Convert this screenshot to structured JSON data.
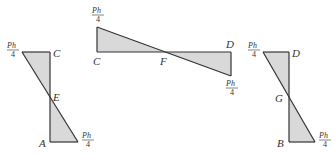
{
  "diagram": {
    "fill_color": "#d9d9d9",
    "stroke_color": "#333333",
    "figures": [
      {
        "id": "left",
        "point_labels": {
          "top": "C",
          "middle": "E",
          "bottom": "A"
        },
        "load_labels": [
          {
            "num": "Ph",
            "den": "4",
            "position": "top-left"
          },
          {
            "num": "Ph",
            "den": "4",
            "position": "bottom-right"
          }
        ]
      },
      {
        "id": "middle",
        "point_labels": {
          "left": "C",
          "middle": "F",
          "right": "D"
        },
        "load_labels": [
          {
            "num": "Ph",
            "den": "4",
            "position": "top-left"
          },
          {
            "num": "Ph",
            "den": "4",
            "position": "bottom-right"
          }
        ]
      },
      {
        "id": "right",
        "point_labels": {
          "top": "D",
          "middle": "G",
          "bottom": "B"
        },
        "load_labels": [
          {
            "num": "Ph",
            "den": "4",
            "position": "top-left"
          },
          {
            "num": "Ph",
            "den": "4",
            "position": "bottom-right"
          }
        ]
      }
    ]
  }
}
